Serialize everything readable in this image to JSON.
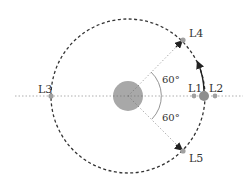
{
  "diagram": {
    "colors": {
      "orbit": "#333333",
      "axis": "#9a9a9a",
      "primary_body": "#a8a8a8",
      "secondary_body": "#8e8e8e",
      "point": "#a0a0a0",
      "arc": "#888888"
    },
    "points": [
      {
        "id": "L1",
        "label": "L1"
      },
      {
        "id": "L2",
        "label": "L2"
      },
      {
        "id": "L3",
        "label": "L3"
      },
      {
        "id": "L4",
        "label": "L4"
      },
      {
        "id": "L5",
        "label": "L5"
      }
    ],
    "angles": [
      {
        "label": "60°"
      },
      {
        "label": "60°"
      }
    ]
  }
}
